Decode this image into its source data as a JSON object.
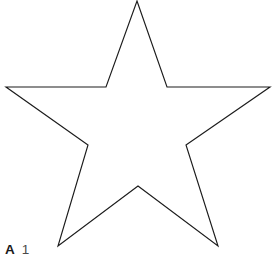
{
  "figure": {
    "domain_kind": "line-drawing",
    "background_color": "#ffffff",
    "stroke_color": "#1c1c1c",
    "stroke_width_px": 1.15,
    "fill": "none",
    "canvas": {
      "width": 275,
      "height": 264
    },
    "top_vertex_clipped_at_canvas_edge": true
  },
  "caption": {
    "panel_letter": "A",
    "figure_number": "1"
  },
  "shape_data": {
    "type": "polygon",
    "name": "star",
    "point_count": 5,
    "closed": true,
    "vertices": [
      {
        "role": "outer-point-top",
        "x": 137,
        "y": 1
      },
      {
        "role": "inner-notch-top-right",
        "x": 167,
        "y": 87
      },
      {
        "role": "outer-point-right",
        "x": 270,
        "y": 87
      },
      {
        "role": "inner-notch-mid-right",
        "x": 186,
        "y": 145
      },
      {
        "role": "outer-point-bottom-right",
        "x": 218,
        "y": 246
      },
      {
        "role": "inner-notch-bottom",
        "x": 138,
        "y": 186
      },
      {
        "role": "outer-point-bottom-left",
        "x": 58,
        "y": 246
      },
      {
        "role": "inner-notch-mid-left",
        "x": 88,
        "y": 145
      },
      {
        "role": "outer-point-left",
        "x": 6,
        "y": 87
      },
      {
        "role": "inner-notch-top-left",
        "x": 106,
        "y": 87
      }
    ],
    "points_attr": "137,1 167,87 270,87 186,145 218,246 138,186 58,246 88,145 6,87 106,87"
  }
}
